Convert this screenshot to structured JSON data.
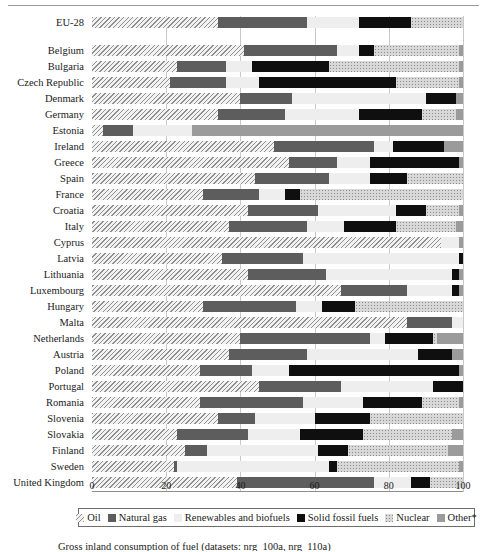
{
  "chart_data": {
    "type": "bar",
    "orientation": "horizontal",
    "stacked": true,
    "title": "",
    "xlabel": "",
    "ylabel": "",
    "xlim": [
      0,
      100
    ],
    "xticks": [
      0,
      20,
      40,
      60,
      80,
      100
    ],
    "grid": true,
    "legend_position": "bottom",
    "series": [
      {
        "name": "Oil",
        "key": "oil",
        "swatch": "hatched"
      },
      {
        "name": "Natural gas",
        "key": "gas",
        "swatch": "dark-gray"
      },
      {
        "name": "Renewables and biofuels",
        "key": "renew",
        "swatch": "very-light-gray"
      },
      {
        "name": "Solid fossil fuels",
        "key": "solid",
        "swatch": "black"
      },
      {
        "name": "Nuclear",
        "key": "nuclear",
        "swatch": "stippled"
      },
      {
        "name": "Other*",
        "key": "other",
        "swatch": "medium-gray"
      }
    ],
    "categories": [
      "EU-28",
      "Belgium",
      "Bulgaria",
      "Czech Republic",
      "Denmark",
      "Germany",
      "Estonia",
      "Ireland",
      "Greece",
      "Spain",
      "France",
      "Croatia",
      "Italy",
      "Cyprus",
      "Latvia",
      "Lithuania",
      "Luxembourg",
      "Hungary",
      "Malta",
      "Netherlands",
      "Austria",
      "Poland",
      "Portugal",
      "Romania",
      "Slovenia",
      "Slovakia",
      "Finland",
      "Sweden",
      "United Kingdom"
    ],
    "rows": [
      {
        "label": "EU-28",
        "gap_before": true,
        "oil": 34,
        "gas": 24,
        "renew": 14,
        "solid": 14,
        "nuclear": 14,
        "other": 0
      },
      {
        "label": "Belgium",
        "gap_before": true,
        "oil": 41,
        "gas": 25,
        "renew": 6,
        "solid": 4,
        "nuclear": 23,
        "other": 1
      },
      {
        "label": "Bulgaria",
        "gap_before": false,
        "oil": 23,
        "gas": 13,
        "renew": 7,
        "solid": 21,
        "nuclear": 35,
        "other": 1
      },
      {
        "label": "Czech Republic",
        "gap_before": false,
        "oil": 21,
        "gas": 15,
        "renew": 9,
        "solid": 37,
        "nuclear": 17,
        "other": 1
      },
      {
        "label": "Denmark",
        "gap_before": false,
        "oil": 40,
        "gas": 14,
        "renew": 36,
        "solid": 8,
        "nuclear": 0,
        "other": 2
      },
      {
        "label": "Germany",
        "gap_before": false,
        "oil": 34,
        "gas": 18,
        "renew": 20,
        "solid": 17,
        "nuclear": 9,
        "other": 2
      },
      {
        "label": "Estonia",
        "gap_before": false,
        "oil": 3,
        "gas": 8,
        "renew": 16,
        "solid": 0,
        "nuclear": 0,
        "other": 73
      },
      {
        "label": "Ireland",
        "gap_before": false,
        "oil": 49,
        "gas": 27,
        "renew": 5,
        "solid": 14,
        "nuclear": 0,
        "other": 5
      },
      {
        "label": "Greece",
        "gap_before": false,
        "oil": 53,
        "gas": 13,
        "renew": 9,
        "solid": 24,
        "nuclear": 0,
        "other": 1
      },
      {
        "label": "Spain",
        "gap_before": false,
        "oil": 44,
        "gas": 20,
        "renew": 11,
        "solid": 10,
        "nuclear": 15,
        "other": 0
      },
      {
        "label": "France",
        "gap_before": false,
        "oil": 30,
        "gas": 15,
        "renew": 7,
        "solid": 4,
        "nuclear": 44,
        "other": 0
      },
      {
        "label": "Croatia",
        "gap_before": false,
        "oil": 42,
        "gas": 19,
        "renew": 21,
        "solid": 8,
        "nuclear": 9,
        "other": 1
      },
      {
        "label": "Italy",
        "gap_before": false,
        "oil": 37,
        "gas": 21,
        "renew": 10,
        "solid": 14,
        "nuclear": 16,
        "other": 2
      },
      {
        "label": "Cyprus",
        "gap_before": false,
        "oil": 94,
        "gas": 0,
        "renew": 5,
        "solid": 0,
        "nuclear": 0,
        "other": 1
      },
      {
        "label": "Latvia",
        "gap_before": false,
        "oil": 35,
        "gas": 22,
        "renew": 42,
        "solid": 1,
        "nuclear": 0,
        "other": 0
      },
      {
        "label": "Lithuania",
        "gap_before": false,
        "oil": 42,
        "gas": 21,
        "renew": 34,
        "solid": 2,
        "nuclear": 0,
        "other": 1
      },
      {
        "label": "Luxembourg",
        "gap_before": false,
        "oil": 67,
        "gas": 18,
        "renew": 12,
        "solid": 2,
        "nuclear": 0,
        "other": 1
      },
      {
        "label": "Hungary",
        "gap_before": false,
        "oil": 30,
        "gas": 25,
        "renew": 7,
        "solid": 9,
        "nuclear": 29,
        "other": 0
      },
      {
        "label": "Malta",
        "gap_before": false,
        "oil": 85,
        "gas": 12,
        "renew": 3,
        "solid": 0,
        "nuclear": 0,
        "other": 0
      },
      {
        "label": "Netherlands",
        "gap_before": false,
        "oil": 40,
        "gas": 35,
        "renew": 4,
        "solid": 13,
        "nuclear": 1,
        "other": 7
      },
      {
        "label": "Austria",
        "gap_before": false,
        "oil": 37,
        "gas": 21,
        "renew": 30,
        "solid": 9,
        "nuclear": 0,
        "other": 3
      },
      {
        "label": "Poland",
        "gap_before": false,
        "oil": 29,
        "gas": 14,
        "renew": 10,
        "solid": 46,
        "nuclear": 0,
        "other": 1
      },
      {
        "label": "Portugal",
        "gap_before": false,
        "oil": 45,
        "gas": 22,
        "renew": 25,
        "solid": 8,
        "nuclear": 0,
        "other": 0
      },
      {
        "label": "Romania",
        "gap_before": false,
        "oil": 29,
        "gas": 28,
        "renew": 16,
        "solid": 16,
        "nuclear": 10,
        "other": 1
      },
      {
        "label": "Slovenia",
        "gap_before": false,
        "oil": 34,
        "gas": 10,
        "renew": 16,
        "solid": 15,
        "nuclear": 25,
        "other": 0
      },
      {
        "label": "Slovakia",
        "gap_before": false,
        "oil": 23,
        "gas": 19,
        "renew": 14,
        "solid": 17,
        "nuclear": 24,
        "other": 3
      },
      {
        "label": "Finland",
        "gap_before": false,
        "oil": 25,
        "gas": 6,
        "renew": 30,
        "solid": 8,
        "nuclear": 27,
        "other": 4
      },
      {
        "label": "Sweden",
        "gap_before": false,
        "oil": 22,
        "gas": 1,
        "renew": 41,
        "solid": 2,
        "nuclear": 33,
        "other": 1
      },
      {
        "label": "United Kingdom",
        "gap_before": false,
        "oil": 39,
        "gas": 37,
        "renew": 10,
        "solid": 5,
        "nuclear": 9,
        "other": 0
      }
    ]
  },
  "legend": {
    "items": [
      {
        "label": "Oil"
      },
      {
        "label": "Natural gas"
      },
      {
        "label": "Renewables and biofuels"
      },
      {
        "label": "Solid fossil fuels"
      },
      {
        "label": "Nuclear"
      },
      {
        "label": "Other*"
      }
    ]
  },
  "caption": {
    "text": "Gross inland consumption of fuel (datasets: nrg_100a, nrg_110a)"
  },
  "colors": {
    "oil": "#8f8f8f",
    "natural_gas": "#5d5d5d",
    "renewables": "#eeeeee",
    "solid_fossil": "#0f0f0f",
    "nuclear": "#d8d8d8",
    "other": "#9b9b9b",
    "grid": "#c9c9c9",
    "axis": "#8d8d8d"
  }
}
